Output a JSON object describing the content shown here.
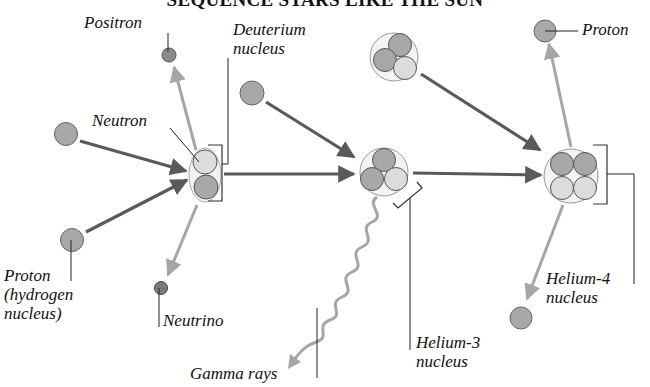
{
  "title": "SEQUENCE STARS LIKE THE SUN",
  "labels": {
    "positron": "Positron",
    "deuterium_line1": "Deuterium",
    "deuterium_line2": "nucleus",
    "neutron": "Neutron",
    "proton_top_right": "Proton",
    "proton_hydrogen_line1": "Proton",
    "proton_hydrogen_line2": "(hydrogen",
    "proton_hydrogen_line3": "nucleus)",
    "neutrino": "Neutrino",
    "gamma_rays": "Gamma rays",
    "helium3_line1": "Helium-3",
    "helium3_line2": "nucleus",
    "helium4_line1": "Helium-4",
    "helium4_line2": "nucleus"
  },
  "colors": {
    "proton_fill": "#a8a8a8",
    "neutron_fill": "#dcdcdc",
    "particle_stroke": "#555555",
    "main_arrow": "#5a5a5a",
    "light_arrow": "#a6a6a6",
    "positron_fill": "#8a8a8a",
    "neutrino_fill": "#7a7a7a",
    "leader_line": "#222222"
  },
  "diagram": {
    "stages": [
      {
        "name": "Deuterium formation",
        "inputs": [
          "Proton",
          "Proton"
        ],
        "outputs": [
          "Deuterium nucleus",
          "Positron",
          "Neutrino"
        ]
      },
      {
        "name": "Helium-3 formation",
        "inputs": [
          "Deuterium nucleus",
          "Proton"
        ],
        "outputs": [
          "Helium-3 nucleus",
          "Gamma rays"
        ]
      },
      {
        "name": "Helium-4 formation",
        "inputs": [
          "Helium-3 nucleus",
          "Helium-3 nucleus"
        ],
        "outputs": [
          "Helium-4 nucleus",
          "Proton",
          "Proton"
        ]
      }
    ]
  }
}
